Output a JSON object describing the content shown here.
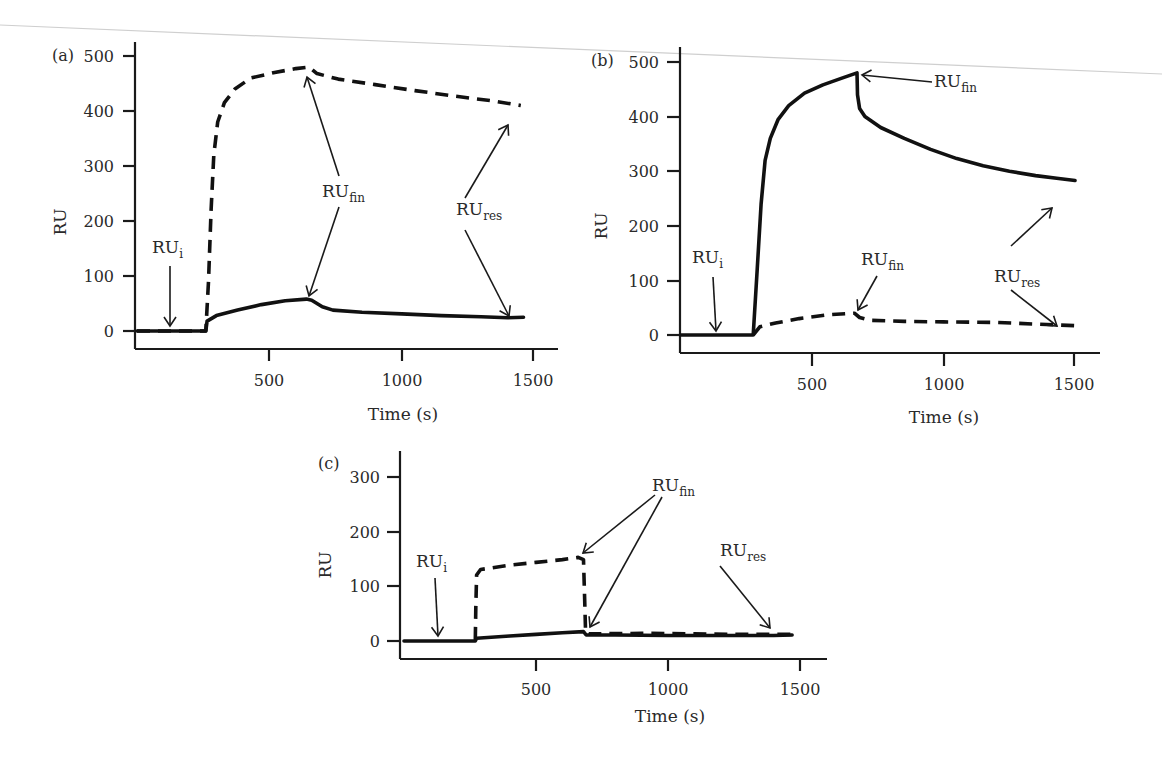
{
  "figure": {
    "annotation_labels": {
      "ru_i": [
        "RU",
        "i"
      ],
      "ru_fin": [
        "RU",
        "fin"
      ],
      "ru_res": [
        "RU",
        "res"
      ]
    }
  },
  "chart_data": [
    {
      "panel": "(a)",
      "type": "line",
      "title": "",
      "xlabel": "Time (s)",
      "ylabel": "RU",
      "xticks": [
        500,
        1000,
        1500
      ],
      "yticks": [
        0,
        100,
        200,
        300,
        400,
        500
      ],
      "xlim": [
        0,
        1600
      ],
      "ylim": [
        -10,
        530
      ],
      "grid": false,
      "legend": null,
      "series": [
        {
          "name": "dashed",
          "style": "dashed",
          "points": [
            [
              0,
              0
            ],
            [
              260,
              0
            ],
            [
              270,
              90
            ],
            [
              280,
              220
            ],
            [
              290,
              320
            ],
            [
              305,
              380
            ],
            [
              330,
              415
            ],
            [
              370,
              440
            ],
            [
              430,
              460
            ],
            [
              520,
              470
            ],
            [
              600,
              477
            ],
            [
              650,
              480
            ],
            [
              680,
              468
            ],
            [
              760,
              458
            ],
            [
              900,
              448
            ],
            [
              1050,
              437
            ],
            [
              1200,
              427
            ],
            [
              1350,
              418
            ],
            [
              1450,
              410
            ]
          ]
        },
        {
          "name": "solid",
          "style": "solid",
          "points": [
            [
              0,
              0
            ],
            [
              260,
              0
            ],
            [
              265,
              18
            ],
            [
              300,
              28
            ],
            [
              380,
              38
            ],
            [
              470,
              48
            ],
            [
              560,
              55
            ],
            [
              640,
              58
            ],
            [
              660,
              56
            ],
            [
              700,
              44
            ],
            [
              740,
              38
            ],
            [
              850,
              34
            ],
            [
              1000,
              31
            ],
            [
              1150,
              28
            ],
            [
              1300,
              26
            ],
            [
              1400,
              24
            ],
            [
              1460,
              25
            ]
          ]
        }
      ],
      "annotations": [
        {
          "label": "RU_i",
          "text_at": [
            135,
            108
          ],
          "arrow_from": [
            135,
            88
          ],
          "arrow_to": [
            135,
            0
          ]
        },
        {
          "label": "RU_fin",
          "text_at": [
            690,
            245
          ],
          "arrow_targets": [
            [
              670,
              475
            ],
            [
              660,
              62
            ]
          ]
        },
        {
          "label": "RU_res",
          "text_at": [
            1230,
            210
          ],
          "arrow_targets": [
            [
              1400,
              406
            ],
            [
              1400,
              28
            ]
          ]
        }
      ]
    },
    {
      "panel": "(b)",
      "type": "line",
      "title": "",
      "xlabel": "Time (s)",
      "ylabel": "RU",
      "xticks": [
        500,
        1000,
        1500
      ],
      "yticks": [
        0,
        100,
        200,
        300,
        400,
        500
      ],
      "xlim": [
        0,
        1600
      ],
      "ylim": [
        -10,
        530
      ],
      "grid": false,
      "legend": null,
      "series": [
        {
          "name": "solid",
          "style": "solid",
          "points": [
            [
              0,
              0
            ],
            [
              275,
              0
            ],
            [
              290,
              120
            ],
            [
              305,
              240
            ],
            [
              320,
              320
            ],
            [
              340,
              360
            ],
            [
              370,
              395
            ],
            [
              410,
              420
            ],
            [
              470,
              443
            ],
            [
              540,
              458
            ],
            [
              610,
              470
            ],
            [
              670,
              480
            ],
            [
              672,
              440
            ],
            [
              680,
              415
            ],
            [
              700,
              400
            ],
            [
              760,
              380
            ],
            [
              850,
              360
            ],
            [
              950,
              340
            ],
            [
              1050,
              323
            ],
            [
              1150,
              310
            ],
            [
              1250,
              300
            ],
            [
              1350,
              292
            ],
            [
              1430,
              287
            ],
            [
              1500,
              283
            ]
          ]
        },
        {
          "name": "dashed",
          "style": "dashed",
          "points": [
            [
              275,
              0
            ],
            [
              300,
              15
            ],
            [
              360,
              22
            ],
            [
              450,
              30
            ],
            [
              560,
              37
            ],
            [
              660,
              40
            ],
            [
              680,
              32
            ],
            [
              720,
              27
            ],
            [
              850,
              25
            ],
            [
              1000,
              24
            ],
            [
              1200,
              23
            ],
            [
              1350,
              20
            ],
            [
              1500,
              17
            ]
          ]
        }
      ],
      "annotations": [
        {
          "label": "RU_i",
          "text_at": [
            110,
            95
          ],
          "arrow_to": [
            125,
            2
          ]
        },
        {
          "label": "RU_fin",
          "text_at": [
            880,
            465
          ],
          "arrow_to": [
            675,
            480
          ]
        },
        {
          "label": "RU_fin",
          "text_at": [
            570,
            225
          ],
          "arrow_to": [
            665,
            42
          ]
        },
        {
          "label": "RU_res",
          "text_at": [
            1180,
            165
          ],
          "arrow_targets": [
            [
              1430,
              290
            ],
            [
              1440,
              22
            ]
          ]
        }
      ]
    },
    {
      "panel": "(c)",
      "type": "line",
      "title": "",
      "xlabel": "Time (s)",
      "ylabel": "RU",
      "xticks": [
        500,
        1000,
        1500
      ],
      "yticks": [
        0,
        100,
        200,
        300
      ],
      "xlim": [
        0,
        1600
      ],
      "ylim": [
        -10,
        350
      ],
      "grid": false,
      "legend": null,
      "series": [
        {
          "name": "dashed",
          "style": "dashed",
          "points": [
            [
              270,
              2
            ],
            [
              272,
              60
            ],
            [
              275,
              120
            ],
            [
              290,
              130
            ],
            [
              400,
              138
            ],
            [
              500,
              143
            ],
            [
              600,
              148
            ],
            [
              660,
              152
            ],
            [
              680,
              148
            ],
            [
              684,
              80
            ],
            [
              688,
              15
            ],
            [
              700,
              13
            ],
            [
              900,
              14
            ],
            [
              1100,
              13
            ],
            [
              1300,
              12
            ],
            [
              1470,
              12
            ]
          ]
        },
        {
          "name": "solid",
          "style": "solid",
          "points": [
            [
              0,
              0
            ],
            [
              270,
              0
            ],
            [
              275,
              5
            ],
            [
              400,
              9
            ],
            [
              500,
              12
            ],
            [
              600,
              15
            ],
            [
              680,
              17
            ],
            [
              690,
              11
            ],
            [
              800,
              11
            ],
            [
              1000,
              10
            ],
            [
              1200,
              10
            ],
            [
              1400,
              10
            ],
            [
              1470,
              11
            ]
          ]
        }
      ],
      "annotations": [
        {
          "label": "RU_i",
          "text_at": [
            40,
            120
          ],
          "arrow_to": [
            160,
            5
          ]
        },
        {
          "label": "RU_fin",
          "text_at": [
            930,
            280
          ],
          "arrow_targets": [
            [
              660,
              155
            ],
            [
              700,
              20
            ]
          ]
        },
        {
          "label": "RU_res",
          "text_at": [
            1220,
            190
          ],
          "arrow_to": [
            1400,
            20
          ]
        }
      ]
    }
  ],
  "panels": [
    {
      "id": "a",
      "label": "(a)",
      "ylabel": "RU",
      "xlabel": "Time (s)",
      "yticks": [
        "0",
        "100",
        "200",
        "300",
        "400",
        "500"
      ],
      "xticks": [
        "500",
        "1000",
        "1500"
      ]
    },
    {
      "id": "b",
      "label": "(b)",
      "ylabel": "RU",
      "xlabel": "Time (s)",
      "yticks": [
        "0",
        "100",
        "200",
        "300",
        "400",
        "500"
      ],
      "xticks": [
        "500",
        "1000",
        "1500"
      ]
    },
    {
      "id": "c",
      "label": "(c)",
      "ylabel": "RU",
      "xlabel": "Time (s)",
      "yticks": [
        "0",
        "100",
        "200",
        "300"
      ],
      "xticks": [
        "500",
        "1000",
        "1500"
      ]
    }
  ]
}
